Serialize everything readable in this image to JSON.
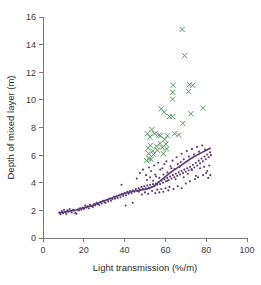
{
  "chart_data": {
    "type": "scatter",
    "title": "",
    "xlabel": "Light transmission (%/m)",
    "ylabel": "Depth of mixed layer (m)",
    "xlim": [
      0,
      100
    ],
    "ylim": [
      0,
      16
    ],
    "xticks": [
      0,
      20,
      40,
      60,
      80,
      100
    ],
    "yticks": [
      0,
      2,
      4,
      6,
      8,
      10,
      12,
      14,
      16
    ],
    "xtick_labels": [
      "0",
      "20",
      "40",
      "60",
      "80",
      "100"
    ],
    "ytick_labels": [
      "0",
      "2",
      "4",
      "6",
      "8",
      "10",
      "12",
      "14",
      "16"
    ],
    "grid": false,
    "legend": "none",
    "colors": {
      "series_dots": "#5b3a7a",
      "series_crosses": "#3f9152",
      "trend_line": "#5b3a7a",
      "axis": "#7a7a7a",
      "text": "#2b2b2b",
      "background": "#ffffff"
    },
    "series": [
      {
        "name": "Mixed layer depth (dots)",
        "marker": "dot",
        "color": "#5b3a7a",
        "points": [
          [
            8.0,
            1.85
          ],
          [
            8.6,
            1.72
          ],
          [
            9.2,
            1.95
          ],
          [
            9.8,
            1.8
          ],
          [
            10.3,
            2.05
          ],
          [
            10.9,
            1.88
          ],
          [
            11.4,
            1.75
          ],
          [
            11.9,
            2.0
          ],
          [
            12.5,
            1.9
          ],
          [
            13.0,
            2.1
          ],
          [
            13.6,
            1.95
          ],
          [
            14.1,
            1.85
          ],
          [
            14.7,
            2.05
          ],
          [
            15.2,
            1.98
          ],
          [
            15.8,
            1.8
          ],
          [
            16.4,
            1.75
          ],
          [
            17.0,
            2.05
          ],
          [
            17.6,
            2.0
          ],
          [
            18.2,
            2.15
          ],
          [
            18.8,
            2.05
          ],
          [
            19.5,
            2.2
          ],
          [
            20.1,
            2.1
          ],
          [
            20.7,
            2.35
          ],
          [
            21.3,
            2.2
          ],
          [
            21.9,
            2.3
          ],
          [
            22.5,
            2.15
          ],
          [
            23.1,
            2.4
          ],
          [
            23.8,
            2.3
          ],
          [
            24.4,
            2.25
          ],
          [
            25.0,
            2.45
          ],
          [
            25.6,
            2.35
          ],
          [
            26.3,
            2.55
          ],
          [
            26.9,
            2.45
          ],
          [
            27.5,
            2.4
          ],
          [
            28.2,
            2.6
          ],
          [
            28.8,
            2.5
          ],
          [
            29.4,
            2.7
          ],
          [
            30.1,
            2.6
          ],
          [
            30.7,
            2.55
          ],
          [
            31.4,
            2.75
          ],
          [
            32.0,
            2.65
          ],
          [
            32.7,
            2.85
          ],
          [
            33.3,
            2.7
          ],
          [
            34.0,
            2.8
          ],
          [
            34.6,
            2.95
          ],
          [
            35.3,
            2.85
          ],
          [
            36.0,
            3.0
          ],
          [
            36.6,
            2.9
          ],
          [
            37.3,
            3.1
          ],
          [
            38.0,
            2.95
          ],
          [
            38.6,
            3.2
          ],
          [
            39.3,
            3.05
          ],
          [
            40.0,
            3.25
          ],
          [
            40.7,
            3.1
          ],
          [
            41.3,
            3.35
          ],
          [
            42.0,
            3.2
          ],
          [
            42.7,
            3.4
          ],
          [
            43.4,
            3.25
          ],
          [
            44.1,
            3.45
          ],
          [
            44.8,
            3.35
          ],
          [
            45.5,
            3.55
          ],
          [
            46.2,
            3.4
          ],
          [
            46.9,
            3.6
          ],
          [
            47.6,
            3.5
          ],
          [
            48.3,
            3.7
          ],
          [
            49.0,
            3.55
          ],
          [
            49.7,
            3.75
          ],
          [
            50.4,
            3.6
          ],
          [
            51.1,
            3.8
          ],
          [
            51.8,
            3.65
          ],
          [
            52.5,
            3.85
          ],
          [
            53.2,
            3.7
          ],
          [
            53.9,
            3.9
          ],
          [
            54.6,
            3.75
          ],
          [
            55.3,
            3.95
          ],
          [
            56.0,
            3.85
          ],
          [
            56.7,
            4.05
          ],
          [
            57.4,
            3.9
          ],
          [
            58.1,
            4.15
          ],
          [
            58.8,
            4.0
          ],
          [
            59.5,
            4.25
          ],
          [
            60.2,
            4.1
          ],
          [
            60.9,
            4.35
          ],
          [
            61.6,
            4.2
          ],
          [
            62.3,
            4.45
          ],
          [
            63.0,
            4.3
          ],
          [
            63.7,
            4.55
          ],
          [
            64.4,
            4.4
          ],
          [
            65.1,
            4.65
          ],
          [
            65.8,
            4.5
          ],
          [
            66.5,
            4.75
          ],
          [
            67.2,
            4.6
          ],
          [
            67.9,
            4.85
          ],
          [
            68.6,
            4.7
          ],
          [
            69.3,
            4.95
          ],
          [
            70.0,
            4.8
          ],
          [
            70.7,
            5.05
          ],
          [
            71.4,
            4.9
          ],
          [
            72.1,
            5.15
          ],
          [
            72.8,
            5.0
          ],
          [
            73.5,
            5.3
          ],
          [
            74.2,
            5.1
          ],
          [
            74.9,
            5.45
          ],
          [
            75.6,
            5.25
          ],
          [
            76.3,
            5.6
          ],
          [
            77.0,
            5.4
          ],
          [
            77.7,
            5.75
          ],
          [
            78.4,
            5.55
          ],
          [
            79.1,
            5.9
          ],
          [
            79.8,
            5.7
          ],
          [
            80.5,
            6.05
          ],
          [
            81.2,
            5.85
          ],
          [
            81.9,
            6.2
          ],
          [
            82.3,
            6.0
          ],
          [
            38.5,
            3.85
          ],
          [
            40.5,
            2.35
          ],
          [
            44.0,
            2.55
          ],
          [
            46.0,
            4.3
          ],
          [
            47.5,
            4.7
          ],
          [
            49.0,
            4.95
          ],
          [
            50.5,
            4.55
          ],
          [
            52.0,
            5.1
          ],
          [
            53.0,
            4.85
          ],
          [
            54.5,
            5.25
          ],
          [
            55.5,
            4.45
          ],
          [
            56.5,
            5.45
          ],
          [
            57.5,
            4.95
          ],
          [
            58.5,
            5.05
          ],
          [
            59.5,
            5.35
          ],
          [
            60.5,
            5.55
          ],
          [
            61.0,
            4.75
          ],
          [
            62.5,
            5.2
          ],
          [
            63.5,
            5.6
          ],
          [
            64.5,
            5.0
          ],
          [
            65.5,
            5.85
          ],
          [
            66.0,
            5.35
          ],
          [
            67.5,
            5.5
          ],
          [
            68.0,
            6.1
          ],
          [
            69.0,
            5.7
          ],
          [
            70.5,
            6.3
          ],
          [
            71.5,
            5.9
          ],
          [
            73.0,
            6.45
          ],
          [
            74.0,
            6.05
          ],
          [
            75.5,
            6.6
          ],
          [
            76.5,
            6.25
          ],
          [
            78.0,
            6.7
          ],
          [
            79.5,
            6.4
          ],
          [
            47.0,
            3.35
          ],
          [
            48.5,
            3.15
          ],
          [
            50.0,
            3.3
          ],
          [
            51.5,
            3.2
          ],
          [
            53.5,
            3.4
          ],
          [
            55.0,
            3.25
          ],
          [
            56.0,
            3.5
          ],
          [
            57.0,
            3.3
          ],
          [
            58.0,
            3.55
          ],
          [
            59.0,
            3.35
          ],
          [
            60.0,
            3.6
          ],
          [
            61.5,
            3.45
          ],
          [
            62.0,
            3.7
          ],
          [
            64.0,
            3.55
          ],
          [
            66.0,
            3.75
          ],
          [
            68.0,
            3.6
          ],
          [
            70.0,
            3.95
          ],
          [
            72.0,
            4.1
          ],
          [
            74.5,
            4.25
          ],
          [
            76.0,
            4.4
          ],
          [
            78.5,
            4.55
          ],
          [
            80.0,
            4.7
          ],
          [
            81.0,
            4.35
          ],
          [
            82.0,
            4.55
          ],
          [
            51.0,
            4.2
          ],
          [
            52.5,
            4.4
          ],
          [
            54.0,
            4.15
          ],
          [
            55.0,
            4.6
          ],
          [
            57.0,
            4.35
          ],
          [
            59.0,
            4.6
          ],
          [
            61.0,
            4.15
          ],
          [
            63.0,
            5.05
          ],
          [
            65.0,
            4.25
          ],
          [
            67.0,
            5.15
          ],
          [
            69.0,
            4.4
          ],
          [
            71.0,
            4.65
          ],
          [
            73.0,
            4.9
          ],
          [
            75.0,
            4.5
          ],
          [
            77.0,
            5.05
          ],
          [
            79.0,
            5.15
          ],
          [
            80.5,
            4.85
          ],
          [
            81.5,
            5.25
          ]
        ]
      },
      {
        "name": "Outlier group (crosses)",
        "marker": "x",
        "color": "#3f9152",
        "points": [
          [
            68.2,
            15.1
          ],
          [
            69.4,
            13.2
          ],
          [
            63.8,
            11.05
          ],
          [
            71.8,
            11.1
          ],
          [
            73.4,
            11.05
          ],
          [
            63.6,
            10.55
          ],
          [
            71.3,
            10.6
          ],
          [
            63.5,
            10.05
          ],
          [
            58.0,
            9.35
          ],
          [
            59.4,
            9.1
          ],
          [
            78.4,
            9.4
          ],
          [
            72.5,
            9.0
          ],
          [
            62.0,
            8.8
          ],
          [
            63.4,
            8.8
          ],
          [
            68.5,
            8.3
          ],
          [
            53.4,
            7.85
          ],
          [
            54.8,
            7.55
          ],
          [
            64.5,
            7.55
          ],
          [
            66.5,
            7.45
          ],
          [
            56.8,
            7.45
          ],
          [
            57.6,
            7.4
          ],
          [
            61.0,
            7.4
          ],
          [
            51.2,
            7.55
          ],
          [
            52.4,
            7.3
          ],
          [
            59.6,
            7.15
          ],
          [
            52.6,
            6.7
          ],
          [
            57.4,
            6.85
          ],
          [
            60.2,
            6.8
          ],
          [
            55.6,
            6.65
          ],
          [
            58.4,
            6.55
          ],
          [
            60.6,
            6.45
          ],
          [
            51.5,
            6.5
          ],
          [
            53.8,
            6.3
          ],
          [
            56.0,
            6.35
          ],
          [
            51.8,
            6.1
          ],
          [
            54.2,
            6.05
          ],
          [
            59.0,
            6.1
          ],
          [
            52.0,
            5.75
          ],
          [
            53.0,
            5.7
          ],
          [
            50.8,
            5.6
          ]
        ]
      }
    ],
    "trend_line": {
      "name": "fitted curve",
      "color": "#5b3a7a",
      "points": [
        [
          8.0,
          1.82
        ],
        [
          12.0,
          1.92
        ],
        [
          16.0,
          2.03
        ],
        [
          20.0,
          2.18
        ],
        [
          24.0,
          2.36
        ],
        [
          28.0,
          2.58
        ],
        [
          32.0,
          2.8
        ],
        [
          36.0,
          3.02
        ],
        [
          40.0,
          3.22
        ],
        [
          44.0,
          3.38
        ],
        [
          48.0,
          3.48
        ],
        [
          50.0,
          3.52
        ],
        [
          52.0,
          3.58
        ],
        [
          54.0,
          3.72
        ],
        [
          56.0,
          3.95
        ],
        [
          58.0,
          4.2
        ],
        [
          60.0,
          4.45
        ],
        [
          62.0,
          4.68
        ],
        [
          64.0,
          4.9
        ],
        [
          66.0,
          5.1
        ],
        [
          68.0,
          5.3
        ],
        [
          70.0,
          5.5
        ],
        [
          72.0,
          5.7
        ],
        [
          74.0,
          5.88
        ],
        [
          76.0,
          6.05
        ],
        [
          78.0,
          6.2
        ],
        [
          80.0,
          6.35
        ],
        [
          82.0,
          6.5
        ]
      ]
    }
  },
  "axes": {
    "x_title": "Light transmission (%/m)",
    "y_title": "Depth of mixed layer (m)"
  }
}
